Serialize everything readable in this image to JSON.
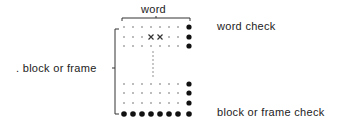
{
  "labels": {
    "word": "word",
    "block_or_frame": ". block or frame",
    "word_check": "word check",
    "block_or_frame_check": "block or frame check"
  },
  "diagram": {
    "columns": 8,
    "data_columns": 7,
    "top_rows": 3,
    "bottom_rows": 3,
    "marked_bits": [
      {
        "row": 1,
        "col": 3
      },
      {
        "row": 1,
        "col": 4
      }
    ],
    "mark_symbol": "x",
    "check_dot_color": "#111111",
    "data_dot_color": "#666666"
  }
}
